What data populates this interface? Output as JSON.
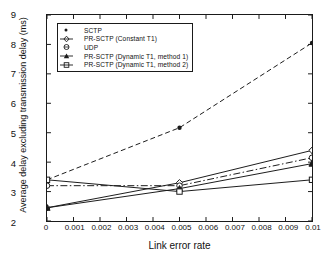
{
  "chart_data": {
    "type": "line",
    "title": "",
    "xlabel": "Link error rate",
    "ylabel": "Average delay excluding transmission delay (ms)",
    "x": [
      0,
      0.005,
      0.01
    ],
    "xlim": [
      0,
      0.01
    ],
    "ylim": [
      2,
      9
    ],
    "xticks": [
      "0",
      "0.001",
      "0.002",
      "0.003",
      "0.004",
      "0.005",
      "0.006",
      "0.007",
      "0.008",
      "0.009",
      "0.01"
    ],
    "xtick_values": [
      0,
      0.001,
      0.002,
      0.003,
      0.004,
      0.005,
      0.006,
      0.007,
      0.008,
      0.009,
      0.01
    ],
    "yticks": [
      "2",
      "3",
      "4",
      "5",
      "6",
      "7",
      "8",
      "9"
    ],
    "ytick_values": [
      2,
      3,
      4,
      5,
      6,
      7,
      8,
      9
    ],
    "grid": false,
    "legend_position": "upper left",
    "series": [
      {
        "name": "SCTP",
        "values": [
          3.4,
          5.17,
          8.05
        ],
        "marker": "dot",
        "linestyle": "dashed",
        "color": "#1a1a1a"
      },
      {
        "name": "PR-SCTP (Constant T1)",
        "values": [
          2.45,
          3.3,
          4.4
        ],
        "marker": "diamond",
        "linestyle": "solid",
        "color": "#1a1a1a"
      },
      {
        "name": "UDP",
        "values": [
          3.2,
          3.2,
          4.15
        ],
        "marker": "circle",
        "linestyle": "dashdot",
        "color": "#1a1a1a"
      },
      {
        "name": "PR-SCTP (Dynamic T1, method 1)",
        "values": [
          2.45,
          3.1,
          3.95
        ],
        "marker": "triangle",
        "linestyle": "solid",
        "color": "#1a1a1a"
      },
      {
        "name": "PR-SCTP (Dynamic T1, method 2)",
        "values": [
          3.4,
          3.0,
          3.4
        ],
        "marker": "square",
        "linestyle": "solid",
        "color": "#1a1a1a"
      }
    ]
  },
  "legend": {
    "items": [
      {
        "label": "SCTP"
      },
      {
        "label": "PR-SCTP (Constant T1)"
      },
      {
        "label": "UDP"
      },
      {
        "label": "PR-SCTP (Dynamic T1, method 1)"
      },
      {
        "label": "PR-SCTP (Dynamic T1, method 2)"
      }
    ]
  },
  "caption": {
    "text": ""
  }
}
